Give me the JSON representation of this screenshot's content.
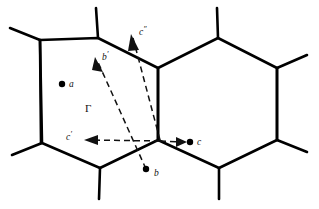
{
  "figure": {
    "background_color": "#ffffff",
    "line_color": "#000000",
    "vector_color": "#111111",
    "width": 319,
    "height": 209
  },
  "lattice": {
    "description": "honeycomb / hexagonal cell network, two full hexagons sharing a central vertical edge",
    "hexagons": [
      {
        "name": "left-hexagon",
        "points": "40,40 98,38 158,68 158,140 100,168 42,143"
      },
      {
        "name": "right-hexagon",
        "points": "158,68 218,38 277,68 277,140 219,168 158,140"
      }
    ],
    "stubs": [
      {
        "name": "stub-top-left",
        "x1": 98,
        "y1": 38,
        "x2": 96,
        "y2": 8
      },
      {
        "name": "stub-left-upper",
        "x1": 40,
        "y1": 40,
        "x2": 10,
        "y2": 28
      },
      {
        "name": "stub-left-vertical",
        "x1": 40,
        "y1": 40,
        "x2": 41,
        "y2": 143
      },
      {
        "name": "stub-left-lower",
        "x1": 42,
        "y1": 143,
        "x2": 12,
        "y2": 155
      },
      {
        "name": "stub-bottom-left",
        "x1": 100,
        "y1": 168,
        "x2": 99,
        "y2": 199
      },
      {
        "name": "stub-top-right",
        "x1": 218,
        "y1": 38,
        "x2": 217,
        "y2": 8
      },
      {
        "name": "stub-right-upper",
        "x1": 277,
        "y1": 68,
        "x2": 307,
        "y2": 55
      },
      {
        "name": "stub-right-vertical",
        "x1": 277,
        "y1": 68,
        "x2": 277,
        "y2": 140
      },
      {
        "name": "stub-right-lower",
        "x1": 277,
        "y1": 140,
        "x2": 307,
        "y2": 152
      },
      {
        "name": "stub-bottom-right",
        "x1": 219,
        "y1": 168,
        "x2": 219,
        "y2": 199
      }
    ]
  },
  "sites": [
    {
      "name": "site-a",
      "label": "a",
      "x": 62,
      "y": 84,
      "label_x": 69,
      "label_y": 83
    },
    {
      "name": "site-b",
      "label": "b",
      "x": 146,
      "y": 169,
      "label_x": 153,
      "label_y": 174
    },
    {
      "name": "site-c",
      "label": "c",
      "x": 190,
      "y": 142,
      "label_x": 197,
      "label_y": 143
    }
  ],
  "vectors": [
    {
      "name": "vector-b-prime",
      "label": "b",
      "prime": "′",
      "from_x": 146,
      "from_y": 169,
      "to_x": 95,
      "to_y": 57,
      "label_x": 102,
      "label_y": 58
    },
    {
      "name": "vector-c-double-prime",
      "label": "c",
      "prime": "″",
      "from_x": 160,
      "from_y": 140,
      "to_x": 131,
      "to_y": 34,
      "label_x": 139,
      "label_y": 33
    },
    {
      "name": "vector-c-prime",
      "label": "c",
      "prime": "′",
      "from_x": 160,
      "from_y": 141,
      "to_x": 84,
      "to_y": 140,
      "label_x": 68,
      "label_y": 138
    },
    {
      "name": "vector-c",
      "label": "c",
      "prime": "",
      "from_x": 160,
      "from_y": 141,
      "to_x": 186,
      "to_y": 142,
      "label_x": 197,
      "label_y": 143
    }
  ],
  "origin_label": {
    "name": "gamma-label",
    "text": "Γ",
    "x": 87,
    "y": 108
  }
}
